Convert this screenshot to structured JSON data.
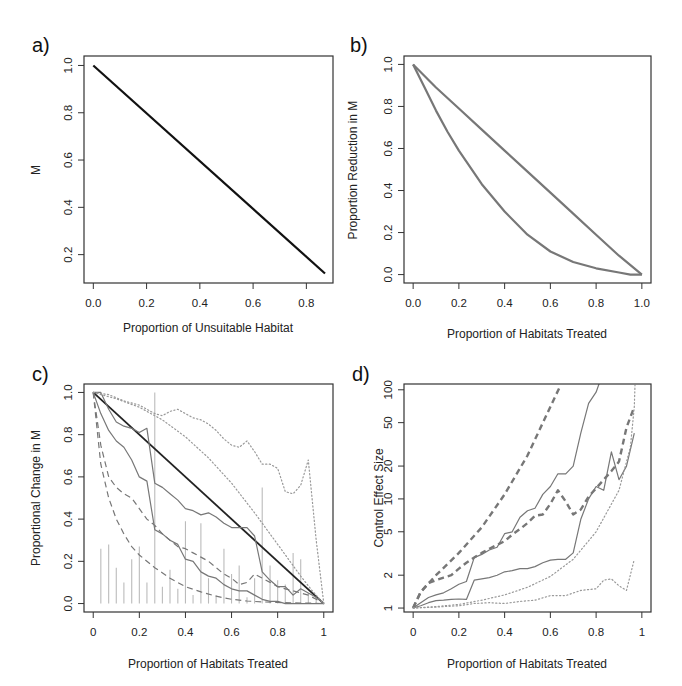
{
  "figure": {
    "panels": [
      "a)",
      "b)",
      "c)",
      "d)"
    ]
  },
  "chart_data": [
    {
      "panel": "a)",
      "type": "line",
      "xlabel": "Proportion of Unsuitable Habitat",
      "ylabel": "M",
      "xticks": [
        "0.0",
        "0.2",
        "0.4",
        "0.6",
        "0.8"
      ],
      "yticks": [
        "0.2",
        "0.4",
        "0.6",
        "0.8",
        "1.0"
      ],
      "xlim": [
        -0.035,
        0.9
      ],
      "ylim": [
        0.08,
        1.04
      ],
      "series": [
        {
          "name": "M",
          "style": "solid",
          "color": "#111111",
          "width": 2.2,
          "x": [
            0.0,
            0.87
          ],
          "y": [
            1.0,
            0.12
          ]
        }
      ]
    },
    {
      "panel": "b)",
      "type": "line",
      "xlabel": "Proportion of Habitats Treated",
      "ylabel": "Proportion Reduction in M",
      "xticks": [
        "0.0",
        "0.2",
        "0.4",
        "0.6",
        "0.8",
        "1.0"
      ],
      "yticks": [
        "0.0",
        "0.2",
        "0.4",
        "0.6",
        "0.8",
        "1.0"
      ],
      "xlim": [
        -0.04,
        1.04
      ],
      "ylim": [
        -0.04,
        1.04
      ],
      "series": [
        {
          "name": "upper",
          "style": "solid",
          "color": "#777777",
          "width": 2.2,
          "x": [
            0.0,
            0.1,
            0.2,
            0.3,
            0.4,
            0.5,
            0.6,
            0.7,
            0.8,
            0.9,
            1.0
          ],
          "y": [
            1.0,
            0.89,
            0.79,
            0.69,
            0.59,
            0.49,
            0.39,
            0.29,
            0.19,
            0.09,
            0.0
          ]
        },
        {
          "name": "lower",
          "style": "solid",
          "color": "#777777",
          "width": 2.2,
          "x": [
            0.0,
            0.05,
            0.1,
            0.15,
            0.2,
            0.3,
            0.4,
            0.5,
            0.6,
            0.7,
            0.8,
            0.9,
            0.95,
            1.0
          ],
          "y": [
            1.0,
            0.89,
            0.78,
            0.68,
            0.59,
            0.43,
            0.3,
            0.19,
            0.11,
            0.06,
            0.03,
            0.01,
            0.0,
            0.0
          ]
        }
      ]
    },
    {
      "panel": "c)",
      "type": "line",
      "xlabel": "Proportion of Habitats Treated",
      "ylabel": "Proportional Change in M",
      "xticks": [
        "0",
        "0.2",
        "0.4",
        "0.6",
        "0.8",
        "1"
      ],
      "yticks": [
        "0.0",
        "0.2",
        "0.4",
        "0.6",
        "0.8",
        "1.0"
      ],
      "xlim": [
        -0.04,
        1.04
      ],
      "ylim": [
        -0.04,
        1.04
      ],
      "series": [
        {
          "name": "reference",
          "style": "solid",
          "color": "#222222",
          "width": 1.8,
          "x": [
            0,
            1
          ],
          "y": [
            1,
            0
          ]
        },
        {
          "name": "solid-upper",
          "style": "solid",
          "color": "#777777",
          "width": 1.2,
          "x": [
            0,
            0.033,
            0.067,
            0.1,
            0.133,
            0.167,
            0.2,
            0.233,
            0.267,
            0.3,
            0.333,
            0.367,
            0.4,
            0.433,
            0.467,
            0.5,
            0.533,
            0.567,
            0.6,
            0.633,
            0.667,
            0.7,
            0.733,
            0.767,
            0.8,
            0.833,
            0.867,
            0.9,
            0.933,
            0.967,
            1.0
          ],
          "y": [
            1.0,
            1.0,
            0.92,
            0.86,
            0.84,
            0.83,
            0.81,
            0.83,
            0.57,
            0.55,
            0.52,
            0.49,
            0.45,
            0.44,
            0.42,
            0.43,
            0.41,
            0.38,
            0.36,
            0.36,
            0.36,
            0.32,
            0.15,
            0.11,
            0.08,
            0.08,
            0.04,
            0.07,
            0.05,
            0.03,
            0.0
          ]
        },
        {
          "name": "solid-lower",
          "style": "solid",
          "color": "#777777",
          "width": 1.2,
          "x": [
            0,
            0.033,
            0.067,
            0.1,
            0.133,
            0.167,
            0.2,
            0.233,
            0.267,
            0.3,
            0.333,
            0.367,
            0.4,
            0.433,
            0.467,
            0.5,
            0.533,
            0.567,
            0.6,
            0.633,
            0.667,
            0.7,
            0.733,
            0.767,
            0.8,
            0.833,
            0.867,
            0.9,
            0.933,
            0.967,
            1.0
          ],
          "y": [
            1.0,
            0.9,
            0.82,
            0.77,
            0.74,
            0.68,
            0.6,
            0.58,
            0.35,
            0.33,
            0.3,
            0.28,
            0.21,
            0.2,
            0.15,
            0.13,
            0.12,
            0.09,
            0.07,
            0.06,
            0.06,
            0.04,
            0.02,
            0.01,
            0.01,
            0.0,
            0.0,
            0.0,
            0.0,
            0.0,
            0.0
          ]
        },
        {
          "name": "dashed-upper",
          "style": "dashed",
          "color": "#777777",
          "width": 1.2,
          "x": [
            0,
            0.033,
            0.067,
            0.1,
            0.133,
            0.167,
            0.2,
            0.233,
            0.267,
            0.3,
            0.333,
            0.367,
            0.4,
            0.433,
            0.467,
            0.5,
            0.533,
            0.567,
            0.6,
            0.633,
            0.667,
            0.7,
            0.733,
            0.767,
            0.8,
            0.833,
            0.867,
            0.9,
            0.933,
            0.967,
            1.0
          ],
          "y": [
            1.0,
            0.75,
            0.6,
            0.55,
            0.52,
            0.5,
            0.45,
            0.4,
            0.37,
            0.33,
            0.3,
            0.27,
            0.26,
            0.24,
            0.22,
            0.2,
            0.17,
            0.14,
            0.12,
            0.09,
            0.1,
            0.14,
            0.12,
            0.1,
            0.08,
            0.07,
            0.06,
            0.05,
            0.04,
            0.02,
            0.0
          ]
        },
        {
          "name": "dashed-lower",
          "style": "dashed",
          "color": "#777777",
          "width": 1.2,
          "x": [
            0,
            0.033,
            0.067,
            0.1,
            0.133,
            0.167,
            0.2,
            0.267,
            0.333,
            0.4,
            0.467,
            0.533,
            0.6,
            0.667,
            0.733,
            0.8,
            0.867,
            0.933,
            1.0
          ],
          "y": [
            1.0,
            0.66,
            0.5,
            0.4,
            0.33,
            0.27,
            0.23,
            0.17,
            0.12,
            0.08,
            0.055,
            0.035,
            0.02,
            0.012,
            0.008,
            0.005,
            0.003,
            0.002,
            0.0
          ]
        },
        {
          "name": "dotted-upper",
          "style": "dotted",
          "color": "#999999",
          "width": 1.2,
          "x": [
            0,
            0.067,
            0.133,
            0.2,
            0.267,
            0.3,
            0.333,
            0.367,
            0.4,
            0.433,
            0.467,
            0.5,
            0.533,
            0.567,
            0.6,
            0.633,
            0.667,
            0.7,
            0.733,
            0.767,
            0.8,
            0.833,
            0.867,
            0.9,
            0.933,
            0.967,
            1.0
          ],
          "y": [
            1.0,
            0.99,
            0.96,
            0.94,
            0.9,
            0.89,
            0.91,
            0.92,
            0.9,
            0.88,
            0.87,
            0.85,
            0.82,
            0.78,
            0.75,
            0.74,
            0.77,
            0.72,
            0.66,
            0.66,
            0.64,
            0.53,
            0.52,
            0.56,
            0.68,
            0.3,
            0.0
          ]
        },
        {
          "name": "dotted-lower",
          "style": "dotted",
          "color": "#999999",
          "width": 1.2,
          "x": [
            0,
            0.1,
            0.2,
            0.3,
            0.4,
            0.5,
            0.6,
            0.7,
            0.8,
            0.9,
            0.95,
            1.0
          ],
          "y": [
            1.0,
            0.97,
            0.93,
            0.87,
            0.79,
            0.69,
            0.57,
            0.43,
            0.28,
            0.13,
            0.06,
            0.0
          ]
        }
      ],
      "bars": {
        "color": "#bbbbbb",
        "x": [
          0.033,
          0.067,
          0.1,
          0.133,
          0.167,
          0.2,
          0.233,
          0.267,
          0.3,
          0.333,
          0.367,
          0.4,
          0.433,
          0.467,
          0.5,
          0.533,
          0.567,
          0.6,
          0.633,
          0.667,
          0.7,
          0.733,
          0.767,
          0.8,
          0.833,
          0.867,
          0.9,
          0.933,
          0.967
        ],
        "y": [
          0.26,
          0.28,
          0.17,
          0.1,
          0.21,
          0.27,
          0.1,
          1.0,
          0.08,
          0.16,
          0.07,
          0.39,
          0.04,
          0.38,
          0.12,
          0.04,
          0.26,
          0.14,
          0.18,
          0.03,
          0.12,
          0.55,
          0.18,
          0.11,
          0.09,
          0.24,
          0.21,
          0.05,
          0.03
        ]
      }
    },
    {
      "panel": "d)",
      "type": "line",
      "xlabel": "Proportion of Habitats Treated",
      "ylabel": "Control Effect Size",
      "yscale": "log",
      "xticks": [
        "0",
        "0.2",
        "0.4",
        "0.6",
        "0.8",
        "1"
      ],
      "yticks": [
        "1",
        "2",
        "5",
        "10",
        "20",
        "50",
        "100"
      ],
      "xlim": [
        -0.04,
        1.04
      ],
      "ylim": [
        0.92,
        113
      ],
      "series": [
        {
          "name": "dashed-steep",
          "style": "dashed",
          "color": "#777777",
          "width": 2.4,
          "x": [
            0,
            0.033,
            0.1,
            0.2,
            0.3,
            0.4,
            0.5,
            0.6,
            0.64
          ],
          "y": [
            1.0,
            1.4,
            2.0,
            3.2,
            5.5,
            11,
            25,
            70,
            105
          ]
        },
        {
          "name": "dashed-mid",
          "style": "dashed",
          "color": "#777777",
          "width": 2.4,
          "x": [
            0,
            0.033,
            0.067,
            0.1,
            0.133,
            0.167,
            0.2,
            0.233,
            0.267,
            0.3,
            0.333,
            0.367,
            0.4,
            0.433,
            0.467,
            0.5,
            0.533,
            0.567,
            0.6,
            0.633,
            0.667,
            0.7,
            0.733,
            0.767,
            0.8,
            0.833,
            0.867,
            0.9,
            0.933,
            0.967
          ],
          "y": [
            1.0,
            1.4,
            1.7,
            1.8,
            1.9,
            2.0,
            2.3,
            2.6,
            2.9,
            3.2,
            3.5,
            3.8,
            4.1,
            4.7,
            5.3,
            6.0,
            7.0,
            7.2,
            9.0,
            12.0,
            9.5,
            7.2,
            8.0,
            10.5,
            12.5,
            15,
            18,
            22,
            45,
            70
          ]
        },
        {
          "name": "solid-upper",
          "style": "solid",
          "color": "#777777",
          "width": 1.2,
          "x": [
            0,
            0.033,
            0.067,
            0.1,
            0.133,
            0.167,
            0.2,
            0.233,
            0.267,
            0.3,
            0.333,
            0.367,
            0.4,
            0.433,
            0.467,
            0.5,
            0.533,
            0.567,
            0.6,
            0.633,
            0.667,
            0.7,
            0.733,
            0.767,
            0.8,
            0.817
          ],
          "y": [
            1.0,
            1.12,
            1.25,
            1.32,
            1.38,
            1.5,
            1.65,
            1.75,
            2.9,
            3.1,
            3.4,
            3.6,
            4.8,
            5.0,
            6.8,
            7.8,
            8.2,
            11,
            13,
            17,
            17,
            20,
            40,
            75,
            95,
            120
          ]
        },
        {
          "name": "solid-lower",
          "style": "solid",
          "color": "#777777",
          "width": 1.2,
          "x": [
            0,
            0.033,
            0.067,
            0.1,
            0.133,
            0.167,
            0.2,
            0.233,
            0.267,
            0.3,
            0.333,
            0.367,
            0.4,
            0.433,
            0.467,
            0.5,
            0.533,
            0.567,
            0.6,
            0.633,
            0.667,
            0.7,
            0.733,
            0.767,
            0.8,
            0.833,
            0.867,
            0.9,
            0.933,
            0.967
          ],
          "y": [
            1.0,
            1.05,
            1.12,
            1.17,
            1.18,
            1.2,
            1.21,
            1.2,
            1.8,
            1.85,
            1.9,
            2.0,
            2.15,
            2.2,
            2.3,
            2.3,
            2.4,
            2.6,
            2.75,
            2.8,
            2.8,
            3.2,
            6.5,
            10,
            13,
            12,
            27,
            15,
            20,
            40
          ]
        },
        {
          "name": "dotted-upper",
          "style": "dotted",
          "color": "#999999",
          "width": 1.2,
          "x": [
            0,
            0.1,
            0.2,
            0.3,
            0.4,
            0.5,
            0.6,
            0.7,
            0.8,
            0.9,
            0.95,
            0.967,
            0.97
          ],
          "y": [
            1.0,
            1.03,
            1.08,
            1.18,
            1.32,
            1.55,
            1.95,
            2.8,
            5.0,
            12,
            30,
            70,
            110
          ]
        },
        {
          "name": "dotted-lower",
          "style": "dotted",
          "color": "#999999",
          "width": 1.2,
          "x": [
            0,
            0.1,
            0.2,
            0.267,
            0.333,
            0.4,
            0.467,
            0.533,
            0.6,
            0.667,
            0.733,
            0.8,
            0.833,
            0.867,
            0.9,
            0.933,
            0.967
          ],
          "y": [
            1.0,
            1.02,
            1.05,
            1.1,
            1.12,
            1.1,
            1.15,
            1.18,
            1.3,
            1.3,
            1.45,
            1.5,
            1.8,
            1.85,
            1.6,
            1.45,
            2.8
          ]
        }
      ]
    }
  ]
}
